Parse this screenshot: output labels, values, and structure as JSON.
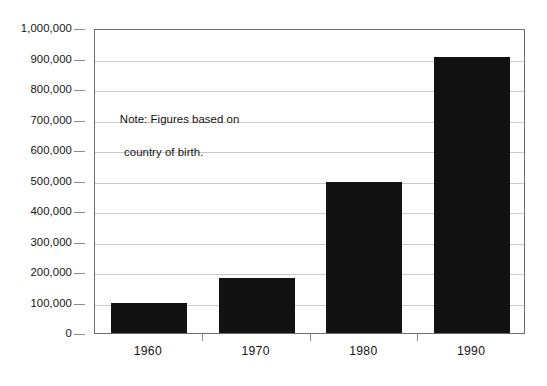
{
  "chart_data": {
    "type": "bar",
    "title": "",
    "xlabel": "",
    "ylabel": "",
    "categories": [
      "1960",
      "1970",
      "1980",
      "1990"
    ],
    "values": [
      100000,
      180000,
      495000,
      905000
    ],
    "ylim": [
      0,
      1000000
    ],
    "ytick_values": [
      0,
      100000,
      200000,
      300000,
      400000,
      500000,
      600000,
      700000,
      800000,
      900000,
      1000000
    ],
    "ytick_labels": [
      "0",
      "100,000",
      "200,000",
      "300,000",
      "400,000",
      "500,000",
      "600,000",
      "700,000",
      "800,000",
      "900,000",
      "1,000,000"
    ],
    "grid": true,
    "legend": "none",
    "bar_color": "#121212",
    "gridline_color": "#c9c9c9",
    "axis_color": "#6c6c6c",
    "annotations": [
      {
        "name": "figures-note",
        "line1": "Note: Figures based on",
        "line2": "country of birth."
      }
    ]
  }
}
